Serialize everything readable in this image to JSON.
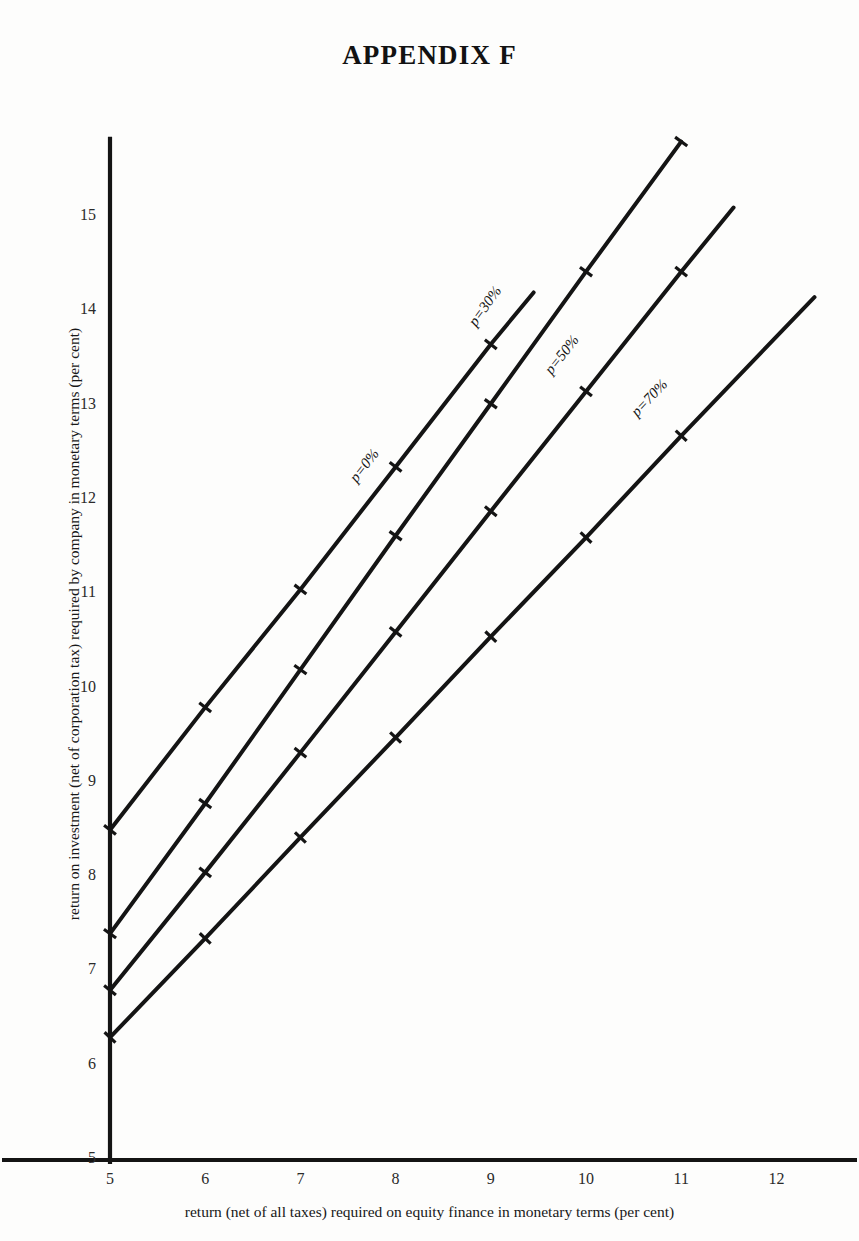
{
  "title": "APPENDIX F",
  "axes": {
    "x_title": "return (net of all taxes) required on equity finance in monetary terms (per cent)",
    "y_title": "return on investment (net of corporation tax) required by company in monetary terms (per cent)",
    "x_ticks": [
      "5",
      "6",
      "7",
      "8",
      "9",
      "10",
      "11",
      "12"
    ],
    "y_ticks": [
      "5",
      "6",
      "7",
      "8",
      "9",
      "10",
      "11",
      "12",
      "13",
      "14",
      "15"
    ]
  },
  "series_labels": {
    "s0": "p=0%",
    "s30": "p=30%",
    "s50": "p=50%",
    "s70": "p=70%"
  },
  "colors": {
    "line": "#141414",
    "axis": "#141414",
    "background": "#fdfdfc",
    "text": "#181818"
  },
  "chart_data": {
    "type": "line",
    "title": "APPENDIX F",
    "subtitle": "",
    "xlabel": "return (net of all taxes) required on equity finance in monetary terms (per cent)",
    "ylabel": "return on investment (net of corporation tax) required by company in monetary terms (per cent)",
    "xlim": [
      5,
      12.45
    ],
    "ylim": [
      5,
      15.85
    ],
    "xticks": [
      5,
      6,
      7,
      8,
      9,
      10,
      11,
      12
    ],
    "yticks": [
      5,
      6,
      7,
      8,
      9,
      10,
      11,
      12,
      13,
      14,
      15
    ],
    "grid": false,
    "legend": "inline-along-line",
    "series": [
      {
        "name": "p=0%",
        "label": "p=0%",
        "x": [
          5,
          6,
          7,
          8,
          9,
          9.45
        ],
        "y": [
          8.5,
          9.8,
          11.05,
          12.35,
          13.65,
          14.2
        ],
        "slope_per_unit": 1.3,
        "markers_at_x": [
          5,
          6,
          7,
          8,
          9
        ],
        "label_at": {
          "x": 7.55,
          "y": 12.2
        }
      },
      {
        "name": "p=30%",
        "label": "p=30%",
        "x": [
          5,
          6,
          7,
          8,
          9,
          10,
          11
        ],
        "y": [
          7.4,
          8.78,
          10.2,
          11.62,
          13.02,
          14.42,
          15.8
        ],
        "slope_per_unit": 1.4,
        "markers_at_x": [
          5,
          6,
          7,
          8,
          9,
          10,
          11
        ],
        "label_at": {
          "x": 8.8,
          "y": 13.85
        }
      },
      {
        "name": "p=50%",
        "label": "p=50%",
        "x": [
          5,
          6,
          7,
          8,
          9,
          10,
          11,
          11.55
        ],
        "y": [
          6.8,
          8.05,
          9.32,
          10.6,
          11.88,
          13.15,
          14.42,
          15.1
        ],
        "slope_per_unit": 1.27,
        "markers_at_x": [
          5,
          6,
          7,
          8,
          9,
          10,
          11
        ],
        "label_at": {
          "x": 9.6,
          "y": 13.35
        }
      },
      {
        "name": "p=70%",
        "label": "p=70%",
        "x": [
          5,
          6,
          7,
          8,
          9,
          10,
          11,
          12.4
        ],
        "y": [
          6.3,
          7.35,
          8.42,
          9.48,
          10.55,
          11.6,
          12.68,
          14.15
        ],
        "slope_per_unit": 1.065,
        "markers_at_x": [
          5,
          6,
          7,
          8,
          9,
          10,
          11
        ],
        "label_at": {
          "x": 10.5,
          "y": 12.9
        }
      }
    ]
  }
}
